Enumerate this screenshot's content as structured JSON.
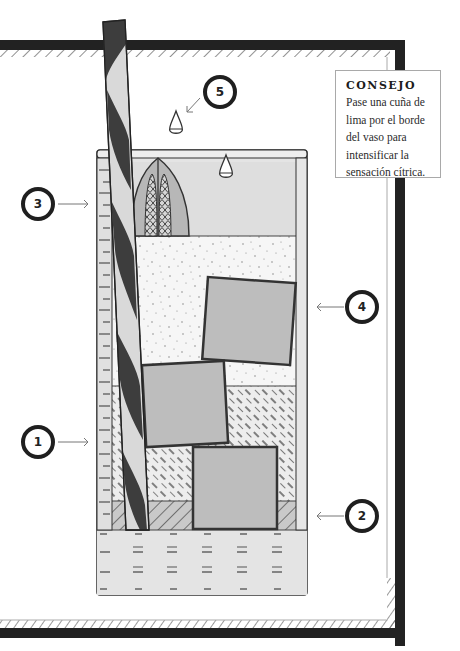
{
  "diagram": {
    "colors": {
      "frame_dark": "#222222",
      "hatch": "#555555",
      "glass_fill": "#e4e4e4",
      "mid_gray": "#b9b9b9",
      "straw_dark": "#3d3d3d",
      "straw_light": "#d9d9d9",
      "ice": "#bdbdbd"
    },
    "tip": {
      "title": "CONSEJO",
      "body": "Pase una cuña de lima por el borde del vaso para intensificar la sensación cítrica."
    },
    "callouts": [
      {
        "number": "1",
        "target": "mid hatched layer (left side)"
      },
      {
        "number": "2",
        "target": "bottom diagonal layer (right side)"
      },
      {
        "number": "3",
        "target": "top of glass / foam (left side)"
      },
      {
        "number": "4",
        "target": "speckled ice layer (right side)"
      },
      {
        "number": "5",
        "target": "drops / lime garnish (top)"
      }
    ],
    "layers": [
      {
        "name": "top-light-layer",
        "pattern": "solid light gray"
      },
      {
        "name": "speckled-layer",
        "pattern": "speckled dots"
      },
      {
        "name": "dashed-hatch-layer",
        "pattern": "dashed diagonal hatch"
      },
      {
        "name": "diagonal-hatch-layer",
        "pattern": "diagonal hatch"
      },
      {
        "name": "base-liquid-layer",
        "pattern": "dash-equals marks"
      }
    ],
    "garnish": "lime wedge with textured pulp",
    "ice_cubes": 3,
    "straw": "spiral striped straw"
  }
}
